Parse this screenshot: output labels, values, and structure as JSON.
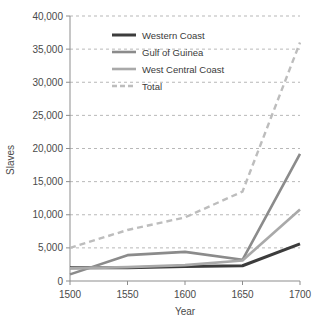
{
  "chart_data": {
    "type": "line",
    "title": "",
    "xlabel": "Year",
    "ylabel": "Slaves",
    "x": [
      1500,
      1550,
      1600,
      1650,
      1700
    ],
    "xlim": [
      1500,
      1700
    ],
    "ylim": [
      0,
      40000
    ],
    "xticks": [
      "1500",
      "1550",
      "1600",
      "1650",
      "1700"
    ],
    "yticks": [
      "0",
      "5,000",
      "10,000",
      "15,000",
      "20,000",
      "25,000",
      "30,000",
      "35,000",
      "40,000"
    ],
    "ytick_values": [
      0,
      5000,
      10000,
      15000,
      20000,
      25000,
      30000,
      35000,
      40000
    ],
    "grid": "horizontal-dashed",
    "legend_position": "upper-left-inside",
    "series": [
      {
        "name": "Western Coast",
        "values": [
          2000,
          2000,
          2200,
          2300,
          5600
        ],
        "color": "#3c3c3c",
        "style": "solid",
        "width": 3.0
      },
      {
        "name": "Gulf of Guinea",
        "values": [
          1000,
          3900,
          4400,
          3200,
          19200
        ],
        "color": "#8b8b8b",
        "style": "solid",
        "width": 2.6
      },
      {
        "name": "West Central Coast",
        "values": [
          1900,
          2100,
          2400,
          3100,
          10800
        ],
        "color": "#a9a9a9",
        "style": "solid",
        "width": 2.6
      },
      {
        "name": "Total",
        "values": [
          5000,
          7700,
          9600,
          13500,
          36000
        ],
        "color": "#bdbdbd",
        "style": "dashed",
        "width": 2.4
      }
    ]
  },
  "legend": {
    "items": [
      {
        "label": "Western Coast"
      },
      {
        "label": "Gulf of Guinea"
      },
      {
        "label": "West Central Coast"
      },
      {
        "label": "Total"
      }
    ]
  },
  "axes": {
    "y_title": "Slaves",
    "x_title": "Year"
  }
}
